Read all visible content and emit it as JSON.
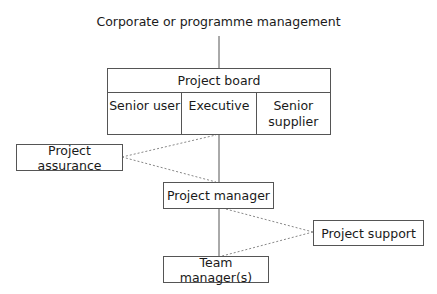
{
  "diagram": {
    "title": "Corporate or programme management",
    "project_board": {
      "label": "Project board",
      "roles": [
        "Senior user",
        "Executive",
        "Senior\nsupplier"
      ]
    },
    "project_assurance": "Project assurance",
    "project_manager": "Project manager",
    "project_support": "Project support",
    "team_manager": "Team manager(s)",
    "colors": {
      "line": "#555555",
      "dotted_line": "#888888",
      "text": "#1a1a1a"
    }
  }
}
